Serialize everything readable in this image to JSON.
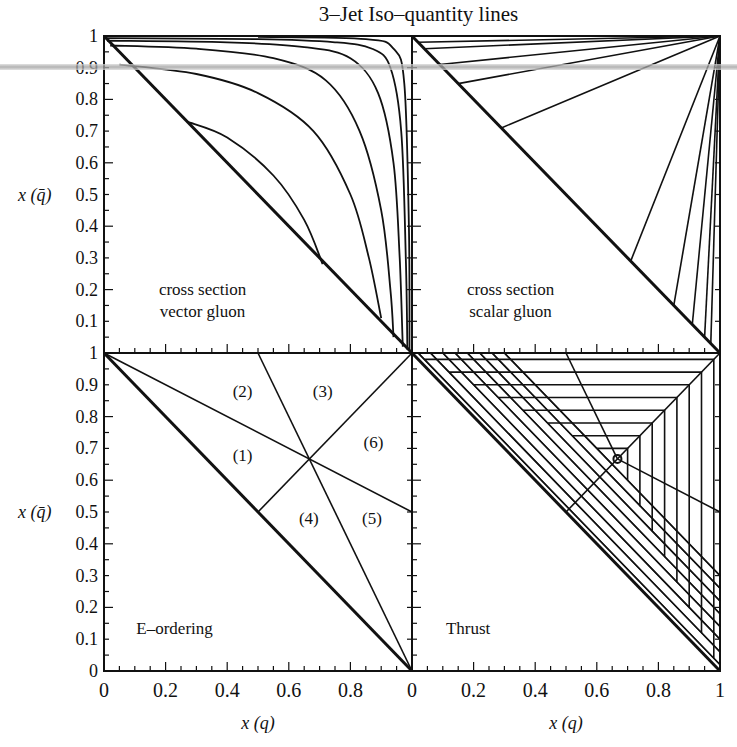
{
  "title": "3–Jet Iso–quantity lines",
  "layout": {
    "x_left": 104,
    "x_mid": 412,
    "x_right": 720,
    "y_top": 36,
    "y_mid": 353,
    "y_bottom": 671
  },
  "axes": {
    "ylabel": "x (q̄)",
    "xlabel": "x (q)",
    "y_ticks": [
      "0.1",
      "0.2",
      "0.3",
      "0.4",
      "0.5",
      "0.6",
      "0.7",
      "0.8",
      "0.9",
      "1"
    ],
    "y_zero": "0",
    "x_ticks_left": [
      "0",
      "0.2",
      "0.4",
      "0.6",
      "0.8"
    ],
    "x_ticks_right": [
      "0",
      "0.2",
      "0.4",
      "0.6",
      "0.8",
      "1"
    ]
  },
  "chart_data": [
    {
      "type": "line",
      "panel": "top-left",
      "label_lines": [
        "cross section",
        "vector gluon"
      ],
      "xlabel": "x(q)",
      "ylabel": "x(q̄)",
      "xlim": [
        0,
        1
      ],
      "ylim": [
        0,
        1
      ],
      "description": "Iso-cross-section curves for vector gluon; diagonal x(q)+x(q̄)=1 boundary",
      "series": [
        {
          "name": "c1",
          "points": [
            [
              0.27,
              0.73
            ],
            [
              0.4,
              0.68
            ],
            [
              0.55,
              0.56
            ],
            [
              0.65,
              0.42
            ],
            [
              0.71,
              0.28
            ]
          ]
        },
        {
          "name": "c2",
          "points": [
            [
              0.05,
              0.91
            ],
            [
              0.3,
              0.88
            ],
            [
              0.5,
              0.82
            ],
            [
              0.68,
              0.7
            ],
            [
              0.8,
              0.5
            ],
            [
              0.86,
              0.3
            ],
            [
              0.9,
              0.11
            ]
          ]
        },
        {
          "name": "c3",
          "points": [
            [
              0.02,
              0.97
            ],
            [
              0.3,
              0.96
            ],
            [
              0.55,
              0.93
            ],
            [
              0.72,
              0.86
            ],
            [
              0.83,
              0.7
            ],
            [
              0.9,
              0.45
            ],
            [
              0.93,
              0.2
            ],
            [
              0.94,
              0.05
            ]
          ]
        },
        {
          "name": "c4",
          "points": [
            [
              0.01,
              0.985
            ],
            [
              0.4,
              0.98
            ],
            [
              0.65,
              0.965
            ],
            [
              0.8,
              0.93
            ],
            [
              0.89,
              0.82
            ],
            [
              0.94,
              0.6
            ],
            [
              0.96,
              0.3
            ],
            [
              0.97,
              0.02
            ]
          ]
        },
        {
          "name": "c5",
          "points": [
            [
              0.01,
              0.993
            ],
            [
              0.5,
              0.99
            ],
            [
              0.75,
              0.98
            ],
            [
              0.87,
              0.96
            ],
            [
              0.93,
              0.9
            ],
            [
              0.965,
              0.7
            ],
            [
              0.98,
              0.3
            ],
            [
              0.985,
              0.01
            ]
          ]
        },
        {
          "name": "c6",
          "points": [
            [
              0.5,
              0.997
            ],
            [
              0.85,
              0.99
            ],
            [
              0.94,
              0.96
            ],
            [
              0.975,
              0.85
            ],
            [
              0.99,
              0.4
            ],
            [
              0.992,
              0.01
            ]
          ]
        }
      ]
    },
    {
      "type": "line",
      "panel": "top-right",
      "label_lines": [
        "cross section",
        "scalar gluon"
      ],
      "xlabel": "x(q)",
      "ylabel": "x(q̄)",
      "xlim": [
        0,
        1
      ],
      "ylim": [
        0,
        1
      ],
      "description": "Straight iso-lines radiating from corner (1,1) to the diagonal",
      "series": [
        {
          "name": "s1",
          "points": [
            [
              1,
              1
            ],
            [
              0.09,
              0.91
            ]
          ]
        },
        {
          "name": "s2",
          "points": [
            [
              1,
              1
            ],
            [
              0.15,
              0.85
            ]
          ]
        },
        {
          "name": "s3",
          "points": [
            [
              1,
              1
            ],
            [
              0.29,
              0.71
            ]
          ]
        },
        {
          "name": "s4",
          "points": [
            [
              1,
              1
            ],
            [
              0.04,
              0.96
            ]
          ]
        },
        {
          "name": "s5",
          "points": [
            [
              1,
              1
            ],
            [
              0.02,
              0.98
            ]
          ]
        },
        {
          "name": "s6",
          "points": [
            [
              1,
              1
            ],
            [
              0.71,
              0.29
            ]
          ]
        },
        {
          "name": "s7",
          "points": [
            [
              1,
              1
            ],
            [
              0.85,
              0.15
            ]
          ]
        },
        {
          "name": "s8",
          "points": [
            [
              1,
              1
            ],
            [
              0.91,
              0.09
            ]
          ]
        },
        {
          "name": "s9",
          "points": [
            [
              1,
              1
            ],
            [
              0.95,
              0.05
            ]
          ]
        },
        {
          "name": "s10",
          "points": [
            [
              1,
              1
            ],
            [
              0.97,
              0.03
            ]
          ]
        }
      ]
    },
    {
      "type": "line",
      "panel": "bottom-left",
      "label_lines": [
        "E–ordering"
      ],
      "xlabel": "x(q)",
      "ylabel": "x(q̄)",
      "xlim": [
        0,
        1
      ],
      "ylim": [
        0,
        1
      ],
      "description": "Six energy-ordering regions meeting at (2/3, 2/3)",
      "regions": [
        {
          "label": "(1)",
          "x": 0.45,
          "y": 0.68
        },
        {
          "label": "(2)",
          "x": 0.45,
          "y": 0.88
        },
        {
          "label": "(3)",
          "x": 0.71,
          "y": 0.88
        },
        {
          "label": "(4)",
          "x": 0.665,
          "y": 0.48
        },
        {
          "label": "(5)",
          "x": 0.87,
          "y": 0.48
        },
        {
          "label": "(6)",
          "x": 0.875,
          "y": 0.72
        }
      ],
      "series": [
        {
          "name": "diag",
          "points": [
            [
              0,
              1
            ],
            [
              1,
              0
            ]
          ]
        },
        {
          "name": "l1",
          "points": [
            [
              0,
              1
            ],
            [
              1,
              0.5
            ]
          ]
        },
        {
          "name": "l2",
          "points": [
            [
              0.5,
              1
            ],
            [
              1,
              0
            ]
          ]
        },
        {
          "name": "l3",
          "points": [
            [
              0.5,
              0.5
            ],
            [
              1,
              1
            ]
          ]
        }
      ]
    },
    {
      "type": "line",
      "panel": "bottom-right",
      "label_lines": [
        "Thrust"
      ],
      "xlabel": "x(q)",
      "ylabel": "x(q̄)",
      "xlim": [
        0,
        1
      ],
      "ylim": [
        0,
        1
      ],
      "description": "Nested iso-thrust contours T = max(x1,x2,x3) with E-ordering lines overlaid",
      "thrust_values": [
        0.98,
        0.94,
        0.9,
        0.86,
        0.82,
        0.78,
        0.74,
        0.7
      ],
      "center_marker": [
        0.667,
        0.667
      ],
      "series": [
        {
          "name": "diag",
          "points": [
            [
              0,
              1
            ],
            [
              1,
              0
            ]
          ]
        },
        {
          "name": "l1",
          "points": [
            [
              0.667,
              0.667
            ],
            [
              1,
              0.5
            ]
          ]
        },
        {
          "name": "l2",
          "points": [
            [
              0.5,
              1
            ],
            [
              0.667,
              0.667
            ]
          ]
        },
        {
          "name": "l3",
          "points": [
            [
              0.5,
              0.5
            ],
            [
              1,
              1
            ]
          ]
        }
      ]
    }
  ],
  "colors": {
    "line": "#111111",
    "background": "#ffffff",
    "scan_artifact": "#a0a0a0"
  }
}
